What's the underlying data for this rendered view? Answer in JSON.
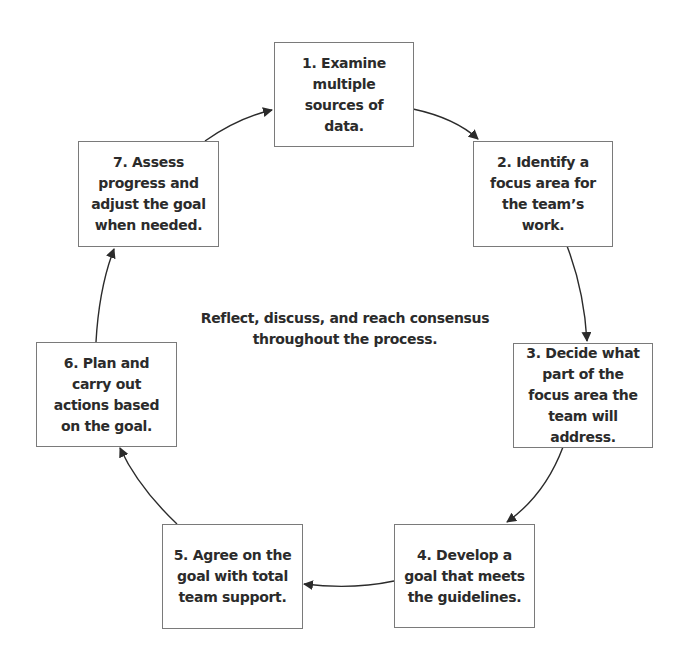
{
  "diagram": {
    "type": "cycle",
    "center_note": "Reflect, discuss, and reach consensus throughout the process.",
    "steps": [
      {
        "id": 1,
        "label": "1. Examine multiple sources of data."
      },
      {
        "id": 2,
        "label": "2. Identify a focus area for the team’s work."
      },
      {
        "id": 3,
        "label": "3. Decide what part of the focus area the team will address."
      },
      {
        "id": 4,
        "label": "4. Develop a goal that meets the guidelines."
      },
      {
        "id": 5,
        "label": "5. Agree on the goal with total team support."
      },
      {
        "id": 6,
        "label": "6. Plan and carry out actions based on the goal."
      },
      {
        "id": 7,
        "label": "7. Assess progress and adjust the goal when needed."
      }
    ],
    "edges": [
      {
        "from": 1,
        "to": 2
      },
      {
        "from": 2,
        "to": 3
      },
      {
        "from": 3,
        "to": 4
      },
      {
        "from": 4,
        "to": 5
      },
      {
        "from": 5,
        "to": 6
      },
      {
        "from": 6,
        "to": 7
      },
      {
        "from": 7,
        "to": 1
      }
    ],
    "colors": {
      "text": "#2b2b2b",
      "border": "#7a7a7a",
      "arrow": "#2b2b2b",
      "background": "#ffffff"
    }
  }
}
